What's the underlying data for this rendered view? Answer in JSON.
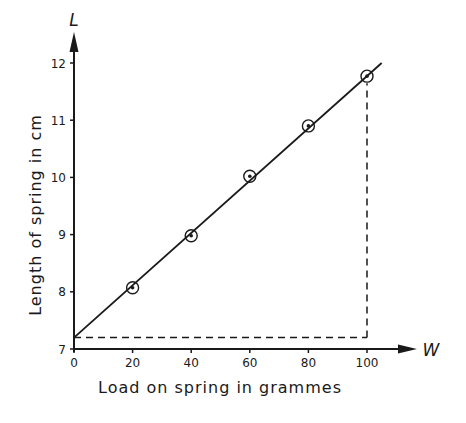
{
  "chart_data": {
    "type": "line",
    "title": "",
    "xlabel": "Load on spring in grammes",
    "ylabel": "Length of spring in cm",
    "x_axis_symbol": "W",
    "y_axis_symbol": "L",
    "xlim": [
      0,
      110
    ],
    "ylim": [
      7,
      12.5
    ],
    "x_ticks": [
      0,
      20,
      40,
      60,
      80,
      100
    ],
    "x_tick_labels": [
      "0",
      "20",
      "40",
      "60",
      "80",
      "100"
    ],
    "y_ticks": [
      7,
      8,
      9,
      10,
      11,
      12
    ],
    "y_tick_labels": [
      "7",
      "8",
      "9",
      "10",
      "11",
      "12"
    ],
    "grid": false,
    "legend": null,
    "series": [
      {
        "name": "Measured points",
        "marker": "circled-dot",
        "x": [
          20,
          40,
          60,
          80,
          100
        ],
        "y": [
          8.07,
          8.98,
          10.02,
          10.9,
          11.77
        ]
      },
      {
        "name": "Best-fit line",
        "style": "solid",
        "x": [
          0,
          105
        ],
        "y": [
          7.2,
          12.0
        ]
      }
    ],
    "annotations": [
      {
        "type": "dashed-horizontal",
        "y": 7.2,
        "x_from": 0,
        "x_to": 100
      },
      {
        "type": "dashed-vertical",
        "x": 100,
        "y_from": 7.2,
        "y_to": 11.77
      }
    ]
  },
  "colors": {
    "ink": "#1a1a1a",
    "background": "#ffffff"
  }
}
